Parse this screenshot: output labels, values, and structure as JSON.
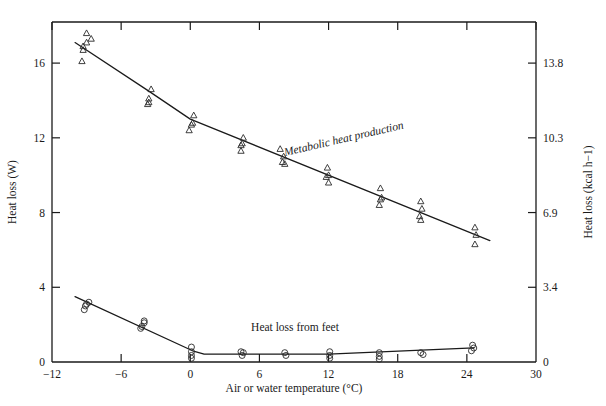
{
  "figure": {
    "title": "",
    "background": "#ffffff",
    "ink": "#1a1a1a"
  },
  "axes": {
    "x_title_main": "Air or water temperature (",
    "x_title_unit_sup": "o",
    "x_title_tail": "C)",
    "x_title_full": "Air or water temperature (°C)",
    "y_left_title": "Heat loss (W)",
    "y_right_title_main": "Heat loss (kcal h",
    "y_right_title_sup": "−1",
    "y_right_title_tail": ")",
    "y_right_title_full": "Heat loss (kcal h−1)",
    "x_ticks": [
      "−12",
      "−6",
      "0",
      "6",
      "12",
      "18",
      "24",
      "30"
    ],
    "x_tick_values": [
      -12,
      -6,
      0,
      6,
      12,
      18,
      24,
      30
    ],
    "y_left_ticks": [
      "0",
      "4",
      "8",
      "12",
      "16"
    ],
    "y_left_tick_values": [
      0,
      4,
      8,
      12,
      16
    ],
    "y_right_ticks": [
      "0",
      "3.4",
      "6.9",
      "10.3",
      "13.8"
    ],
    "y_right_tick_values": [
      0,
      3.4,
      6.9,
      10.3,
      13.8
    ]
  },
  "annotations": [
    {
      "name": "metabolic-heat-production-label",
      "text": "Metabolic heat production",
      "style": "italic"
    },
    {
      "name": "heat-loss-from-feet-label",
      "text": "Heat loss from feet",
      "style": "normal"
    }
  ],
  "chart_data": {
    "type": "scatter",
    "title": "",
    "xlabel": "Air or water temperature (°C)",
    "ylabel": "Heat loss (W)",
    "ylabel_secondary": "Heat loss (kcal h−1)",
    "xlim": [
      -12,
      30
    ],
    "ylim": [
      0,
      18.2
    ],
    "ylim_secondary": [
      0,
      15.7
    ],
    "grid": false,
    "legend": "none (in-plot text annotations)",
    "series": [
      {
        "name": "Metabolic heat production",
        "marker": "open-triangle",
        "line": "fitted polyline",
        "points": [
          {
            "x": -9.0,
            "y": 17.6
          },
          {
            "x": -9.0,
            "y": 17.1
          },
          {
            "x": -9.3,
            "y": 16.9
          },
          {
            "x": -9.3,
            "y": 16.7
          },
          {
            "x": -8.6,
            "y": 17.3
          },
          {
            "x": -9.4,
            "y": 16.1
          },
          {
            "x": -3.4,
            "y": 14.6
          },
          {
            "x": -3.6,
            "y": 14.1
          },
          {
            "x": -3.6,
            "y": 13.9
          },
          {
            "x": -3.7,
            "y": 13.8
          },
          {
            "x": 0.3,
            "y": 13.2
          },
          {
            "x": 0.2,
            "y": 12.8
          },
          {
            "x": 0.1,
            "y": 12.7
          },
          {
            "x": -0.1,
            "y": 12.4
          },
          {
            "x": 4.6,
            "y": 12.0
          },
          {
            "x": 4.5,
            "y": 11.7
          },
          {
            "x": 4.4,
            "y": 11.6
          },
          {
            "x": 4.4,
            "y": 11.3
          },
          {
            "x": 7.8,
            "y": 11.4
          },
          {
            "x": 8.1,
            "y": 11.0
          },
          {
            "x": 8.0,
            "y": 10.7
          },
          {
            "x": 8.2,
            "y": 10.6
          },
          {
            "x": 11.9,
            "y": 10.4
          },
          {
            "x": 12.0,
            "y": 10.0
          },
          {
            "x": 11.8,
            "y": 9.9
          },
          {
            "x": 12.0,
            "y": 9.6
          },
          {
            "x": 16.5,
            "y": 9.3
          },
          {
            "x": 16.6,
            "y": 8.8
          },
          {
            "x": 16.5,
            "y": 8.7
          },
          {
            "x": 16.4,
            "y": 8.4
          },
          {
            "x": 20.0,
            "y": 8.6
          },
          {
            "x": 20.1,
            "y": 8.2
          },
          {
            "x": 19.9,
            "y": 7.8
          },
          {
            "x": 20.0,
            "y": 7.6
          },
          {
            "x": 24.7,
            "y": 7.2
          },
          {
            "x": 24.8,
            "y": 6.8
          },
          {
            "x": 24.7,
            "y": 6.3
          }
        ],
        "fit_line": [
          {
            "x": -10.0,
            "y": 17.1
          },
          {
            "x": -3.6,
            "y": 14.5
          },
          {
            "x": 0.0,
            "y": 13.0
          },
          {
            "x": 26.0,
            "y": 6.5
          }
        ]
      },
      {
        "name": "Heat loss from feet",
        "marker": "open-circle",
        "line": "fitted polyline",
        "points": [
          {
            "x": -8.8,
            "y": 3.2
          },
          {
            "x": -9.1,
            "y": 3.0
          },
          {
            "x": -9.2,
            "y": 2.8
          },
          {
            "x": -9.0,
            "y": 3.1
          },
          {
            "x": -4.0,
            "y": 2.2
          },
          {
            "x": -4.0,
            "y": 2.1
          },
          {
            "x": -4.2,
            "y": 1.9
          },
          {
            "x": -4.3,
            "y": 1.8
          },
          {
            "x": 0.1,
            "y": 0.8
          },
          {
            "x": 0.1,
            "y": 0.55
          },
          {
            "x": 0.1,
            "y": 0.35
          },
          {
            "x": 0.1,
            "y": 0.2
          },
          {
            "x": 4.4,
            "y": 0.55
          },
          {
            "x": 4.6,
            "y": 0.5
          },
          {
            "x": 4.5,
            "y": 0.35
          },
          {
            "x": 8.2,
            "y": 0.5
          },
          {
            "x": 8.3,
            "y": 0.35
          },
          {
            "x": 12.1,
            "y": 0.55
          },
          {
            "x": 12.1,
            "y": 0.35
          },
          {
            "x": 12.1,
            "y": 0.2
          },
          {
            "x": 16.4,
            "y": 0.5
          },
          {
            "x": 16.4,
            "y": 0.3
          },
          {
            "x": 16.4,
            "y": 0.15
          },
          {
            "x": 20.0,
            "y": 0.5
          },
          {
            "x": 20.2,
            "y": 0.4
          },
          {
            "x": 24.5,
            "y": 0.9
          },
          {
            "x": 24.6,
            "y": 0.75
          },
          {
            "x": 24.4,
            "y": 0.6
          }
        ],
        "fit_line": [
          {
            "x": -10.0,
            "y": 3.5
          },
          {
            "x": 0.2,
            "y": 0.6
          },
          {
            "x": 1.2,
            "y": 0.42
          },
          {
            "x": 12.0,
            "y": 0.42
          },
          {
            "x": 24.6,
            "y": 0.75
          }
        ]
      }
    ]
  }
}
